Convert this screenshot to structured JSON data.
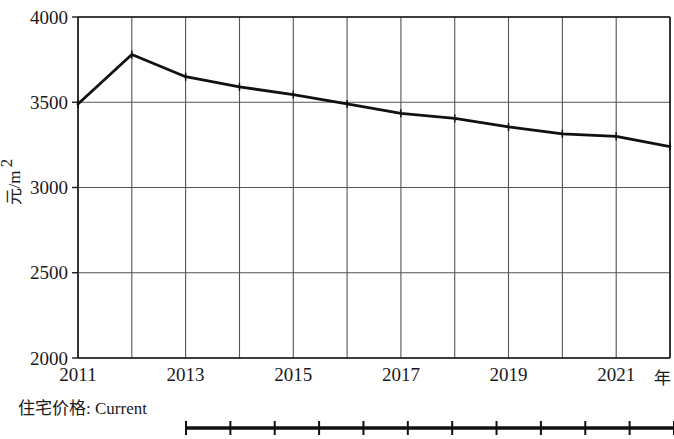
{
  "chart_data": {
    "type": "line",
    "title": "",
    "subtitle": "",
    "xlabel": "年",
    "ylabel": "元/m²",
    "xlim": [
      2011,
      2022
    ],
    "ylim": [
      2000,
      4000
    ],
    "x": [
      2011,
      2012,
      2013,
      2014,
      2015,
      2016,
      2017,
      2018,
      2019,
      2020,
      2021,
      2022
    ],
    "xtick_labels": [
      "2011",
      "2013",
      "2015",
      "2017",
      "2019",
      "2021"
    ],
    "xtick_values": [
      2011,
      2013,
      2015,
      2017,
      2019,
      2021
    ],
    "ytick_labels": [
      "2000",
      "2500",
      "3000",
      "3500",
      "4000"
    ],
    "ytick_values": [
      2000,
      2500,
      3000,
      3500,
      4000
    ],
    "grid": true,
    "grid_x": true,
    "grid_y": true,
    "legend_position": "below-left",
    "series": [
      {
        "name": "住宅价格: Current",
        "color": "#111111",
        "marker": "plus",
        "values": [
          3490,
          3780,
          3650,
          3590,
          3545,
          3490,
          3435,
          3405,
          3355,
          3315,
          3300,
          3240
        ]
      }
    ],
    "annotations": []
  },
  "axes": {
    "y_axis_title": "元/m²",
    "y_axis_unit_base": "元/m",
    "y_axis_unit_sup": "2",
    "x_axis_title": "年",
    "y_ticks": [
      "4000",
      "3500",
      "3000",
      "2500",
      "2000"
    ],
    "x_ticks": [
      "2011",
      "2013",
      "2015",
      "2017",
      "2019",
      "2021"
    ]
  },
  "legend": {
    "label": "住宅价格: Current",
    "marker_count": 12
  },
  "colors": {
    "line": "#111111",
    "grid": "#4a4a4a",
    "axis": "#1a1a1a",
    "background": "#ffffff",
    "text": "#1a1a1a"
  }
}
